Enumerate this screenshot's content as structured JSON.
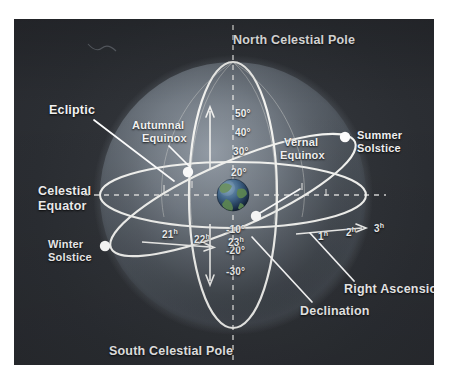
{
  "figure": {
    "background_color": "#2e3136",
    "page_color": "#ffffff",
    "line_color": "#f0f0ee",
    "node_color": "#ffffff",
    "text_color": "#f2f2f2"
  },
  "poles": {
    "north": "North Celestial Pole",
    "south": "South Celestial Pole"
  },
  "circles": {
    "ecliptic_label": "Ecliptic",
    "celestial_equator_label_line1": "Celestial",
    "celestial_equator_label_line2": "Equator"
  },
  "nodes": [
    {
      "id": "autumnal-equinox",
      "label_line1": "Autumnal",
      "label_line2": "Equinox",
      "x": 188,
      "y": 172
    },
    {
      "id": "vernal-equinox",
      "label_line1": "Vernal",
      "label_line2": "Equinox",
      "x": 256,
      "y": 216
    },
    {
      "id": "summer-solstice",
      "label_line1": "Summer",
      "label_line2": "Solstice",
      "x": 345,
      "y": 137
    },
    {
      "id": "winter-solstice",
      "label_line1": "Winter",
      "label_line2": "Solstice",
      "x": 105,
      "y": 246
    }
  ],
  "axes": {
    "right_ascension_label": "Right Ascension",
    "declination_label": "Declination"
  },
  "declination_ticks": [
    {
      "value": "50°"
    },
    {
      "value": "40°"
    },
    {
      "value": "30°"
    },
    {
      "value": "20°"
    },
    {
      "value": "-10°"
    },
    {
      "value": "-20°"
    },
    {
      "value": "-30°"
    }
  ],
  "right_ascension_ticks": [
    {
      "hour": "21",
      "unit": "h"
    },
    {
      "hour": "22",
      "unit": "h"
    },
    {
      "hour": "23",
      "unit": "h"
    },
    {
      "hour": "1",
      "unit": "h"
    },
    {
      "hour": "2",
      "unit": "h"
    },
    {
      "hour": "3",
      "unit": "h"
    }
  ],
  "earth": {
    "name": "earth-globe"
  }
}
